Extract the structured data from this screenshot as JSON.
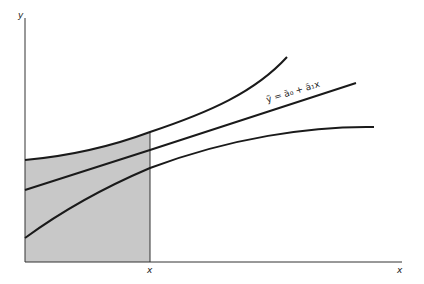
{
  "diagram": {
    "axes": {
      "y_label": "y",
      "x_label": "x"
    },
    "shaded_region": {
      "bound_label": "x",
      "fill_color": "#c8c8c8"
    },
    "regression_line_label": "ỹ = ā₀ + ā₁x",
    "curves": [
      {
        "name": "upper-confidence-band"
      },
      {
        "name": "regression-line"
      },
      {
        "name": "lower-confidence-band"
      }
    ],
    "line_color": "#1a1a1a"
  }
}
